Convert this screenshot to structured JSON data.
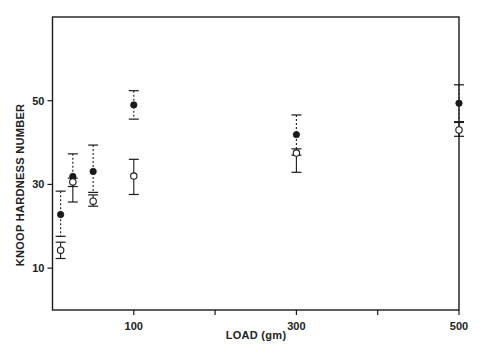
{
  "chart_data": {
    "type": "scatter",
    "title": "",
    "xlabel": "LOAD (gm)",
    "ylabel": "KNOOP HARDNESS NUMBER",
    "xlim": [
      0,
      500
    ],
    "ylim": [
      0,
      70
    ],
    "x_ticks": [
      100,
      200,
      300,
      400,
      500
    ],
    "x_tick_labels": [
      "100",
      "",
      "300",
      "",
      "500"
    ],
    "y_ticks": [
      10,
      30,
      50
    ],
    "y_tick_labels": [
      "10",
      "30",
      "50"
    ],
    "grid": false,
    "legend": null,
    "series": [
      {
        "name": "filled",
        "marker": "filled-circle",
        "errorbar_style": "dotted",
        "x": [
          10,
          25,
          50,
          100,
          300,
          500
        ],
        "y": [
          22.8,
          31.9,
          33.1,
          49.0,
          41.9,
          49.4
        ],
        "y_upper": [
          28.4,
          37.3,
          39.4,
          52.4,
          46.6,
          53.8
        ],
        "y_lower": [
          17.6,
          29.5,
          28.1,
          45.6,
          37.0,
          45.0
        ]
      },
      {
        "name": "open",
        "marker": "open-circle",
        "errorbar_style": "solid",
        "x": [
          10,
          25,
          50,
          100,
          300,
          500
        ],
        "y": [
          14.3,
          30.6,
          26.0,
          32.0,
          37.5,
          43.0
        ],
        "y_upper": [
          16.2,
          31.5,
          27.5,
          36.0,
          38.5,
          44.8
        ],
        "y_lower": [
          12.3,
          25.8,
          24.8,
          27.6,
          32.9,
          41.5
        ]
      }
    ]
  },
  "colors": {
    "ink": "#1a1a1a",
    "background": "#ffffff"
  }
}
